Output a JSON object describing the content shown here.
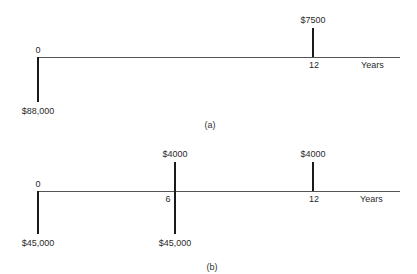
{
  "diagrams": {
    "a": {
      "caption": "(a)",
      "axis_unit": "Years",
      "ticks": {
        "start": "0",
        "end": "12"
      },
      "flows": [
        {
          "period": "0",
          "direction": "down",
          "amount": "$88,000"
        },
        {
          "period": "12",
          "direction": "up",
          "amount": "$7500"
        }
      ]
    },
    "b": {
      "caption": "(b)",
      "axis_unit": "Years",
      "ticks": {
        "start": "0",
        "mid": "6",
        "end": "12"
      },
      "flows": [
        {
          "period": "0",
          "direction": "down",
          "amount": "$45,000"
        },
        {
          "period": "6",
          "direction": "up",
          "amount": "$4000"
        },
        {
          "period": "6",
          "direction": "down",
          "amount": "$45,000"
        },
        {
          "period": "12",
          "direction": "up",
          "amount": "$4000"
        }
      ]
    }
  },
  "colors": {
    "line": "#1a1a1a",
    "axis": "#555555",
    "text": "#2a2a2a"
  }
}
